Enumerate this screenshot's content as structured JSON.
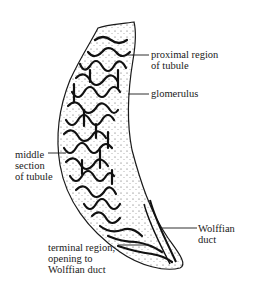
{
  "diagram": {
    "labels": {
      "proximal": "proximal region\nof tubule",
      "glomerulus": "glomerulus",
      "middle": "middle\nsection\nof tubule",
      "wolffian": "Wolffian\nduct",
      "terminal": "terminal region,\nopening to\nWolffian duct"
    },
    "colors": {
      "ink": "#1a1a1a",
      "background": "#ffffff"
    }
  }
}
